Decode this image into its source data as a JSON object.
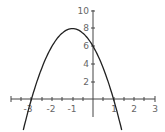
{
  "chart_data": {
    "type": "line",
    "title": "",
    "xlabel": "",
    "ylabel": "",
    "function": "y = -2(x+1)^2 + 8",
    "series": [
      {
        "name": "parabola",
        "x": [
          -3.4,
          -3,
          -2.5,
          -2,
          -1.5,
          -1,
          -0.5,
          0,
          0.5,
          1,
          1.4
        ],
        "values": [
          -1.92,
          0,
          3.5,
          6,
          7.5,
          8,
          7.5,
          6,
          3.5,
          0,
          -3.52
        ]
      }
    ],
    "key_points": {
      "vertex": [
        -1,
        8
      ],
      "roots": [
        -3,
        1
      ],
      "y_intercept": 6
    },
    "xlim": [
      -3.9,
      3.1
    ],
    "ylim": [
      -2.1,
      10.1
    ],
    "x_ticks": [
      "-3",
      "-2",
      "-1",
      "1",
      "2",
      "3"
    ],
    "y_ticks": [
      "2",
      "4",
      "6",
      "8",
      "10"
    ],
    "grid": false,
    "colors": {
      "curve": "#222222",
      "axis": "#444444",
      "labels": "#666666"
    }
  }
}
